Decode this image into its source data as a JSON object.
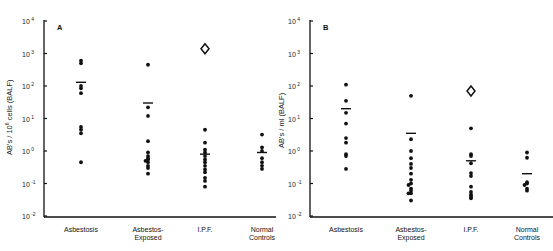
{
  "chart_data": [
    {
      "type": "scatter",
      "panel": "A",
      "title": "A",
      "xlabel": "",
      "ylabel": "AB's / 10^6 cells (BALF)",
      "yscale": "log",
      "ylim": [
        0.01,
        10000
      ],
      "yticks": [
        "10^-2",
        "10^-1",
        "10^0",
        "10^1",
        "10^2",
        "10^3",
        "10^4"
      ],
      "grid": false,
      "categories": [
        "Asbestosis",
        "Asbestos-Exposed",
        "I.P.F.",
        "Normal Controls"
      ],
      "series": [
        {
          "name": "Asbestosis",
          "values": [
            600,
            500,
            100,
            85,
            60,
            5.5,
            4.5,
            3.5,
            0.45
          ],
          "mean": 130
        },
        {
          "name": "Asbestos-Exposed",
          "values": [
            450,
            22,
            12,
            2.0,
            0.9,
            0.7,
            0.6,
            0.55,
            0.5,
            0.45,
            0.35,
            0.3,
            0.2
          ],
          "mean": 30
        },
        {
          "name": "I.P.F.",
          "values": [
            4.5,
            1.8,
            1.1,
            0.9,
            0.7,
            0.55,
            0.45,
            0.35,
            0.27,
            0.22,
            0.15,
            0.12,
            0.08
          ],
          "mean": 0.8,
          "outlier_diamond": 1400
        },
        {
          "name": "Normal Controls",
          "values": [
            3.2,
            1.3,
            1.0,
            0.6,
            0.45,
            0.35,
            0.28
          ],
          "mean": 0.9
        }
      ]
    },
    {
      "type": "scatter",
      "panel": "B",
      "title": "B",
      "xlabel": "",
      "ylabel": "AB's / ml (BALF)",
      "yscale": "log",
      "ylim": [
        0.01,
        10000
      ],
      "yticks": [
        "10^-2",
        "10^-1",
        "10^0",
        "10^1",
        "10^2",
        "10^3",
        "10^4"
      ],
      "grid": false,
      "categories": [
        "Asbestosis",
        "Asbestos-Exposed",
        "I.P.F.",
        "Normal Controls"
      ],
      "series": [
        {
          "name": "Asbestosis",
          "values": [
            110,
            35,
            15,
            7,
            2.5,
            1.8,
            0.8,
            0.7,
            0.28
          ],
          "mean": 20
        },
        {
          "name": "Asbestos-Exposed",
          "values": [
            50,
            2.3,
            1.0,
            0.6,
            0.4,
            0.3,
            0.2,
            0.13,
            0.1,
            0.09,
            0.07,
            0.06,
            0.05,
            0.05,
            0.03
          ],
          "mean": 3.5
        },
        {
          "name": "I.P.F.",
          "values": [
            5.0,
            0.8,
            0.7,
            0.42,
            0.21,
            0.17,
            0.08,
            0.055,
            0.045,
            0.04,
            0.035
          ],
          "mean": 0.5,
          "outlier_diamond": 70
        },
        {
          "name": "Normal Controls",
          "values": [
            0.9,
            0.62,
            0.11,
            0.1,
            0.09,
            0.07,
            0.06
          ],
          "mean": 0.2
        }
      ]
    }
  ],
  "panels": [
    {
      "letter": "A",
      "ylabel_main": "AB's / 10",
      "ylabel_sup": "6",
      "ylabel_tail": " cells (BALF)",
      "categories": [
        "Asbestosis",
        "Asbestos-",
        "I.P.F.",
        "Normal"
      ],
      "categories_line2": [
        "",
        "Exposed",
        "",
        "Controls"
      ]
    },
    {
      "letter": "B",
      "ylabel_main": "AB's / ml (BALF)",
      "categories": [
        "Asbestosis",
        "Asbestos-",
        "I.P.F.",
        "Normal"
      ],
      "categories_line2": [
        "",
        "Exposed",
        "",
        "Controls"
      ]
    }
  ],
  "ytick_base": "10",
  "ytick_exps": [
    "4",
    "3",
    "2",
    "1",
    "0",
    "-1",
    "-2"
  ]
}
